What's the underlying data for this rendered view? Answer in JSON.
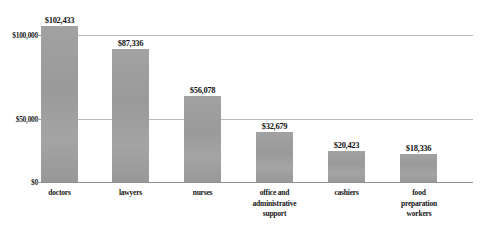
{
  "chart_data": {
    "type": "bar",
    "title": "",
    "subtitle": "",
    "xlabel": "",
    "ylabel": "",
    "categories": [
      "doctors",
      "lawyers",
      "nurses",
      "office and administrative support",
      "cashiers",
      "food preparation workers"
    ],
    "category_lines": [
      [
        "doctors"
      ],
      [
        "lawyers"
      ],
      [
        "nurses"
      ],
      [
        "office and",
        "administrative",
        "support"
      ],
      [
        "cashiers"
      ],
      [
        "food",
        "preparation",
        "workers"
      ]
    ],
    "values": [
      102433,
      87336,
      56078,
      32679,
      20423,
      18336
    ],
    "value_labels": [
      "$102,433",
      "$87,336",
      "$56,078",
      "$32,679",
      "$20,423",
      "$18,336"
    ],
    "ylim": [
      0,
      110000
    ],
    "ytick_values": [
      0,
      50000,
      100000
    ],
    "ytick_labels": [
      "$0",
      "$50,000",
      "$100,000"
    ],
    "grid": true,
    "gridlines_at": [
      50000,
      100000
    ],
    "legend": "none",
    "legend_position": "none",
    "bar_color": "#9d9d9d",
    "gridline_color": "#b9b9bc",
    "axis_color": "#8f8f93",
    "text_color": "#141414",
    "background_color": "#ffffff"
  },
  "artifacts": {
    "top_clipped_text": ""
  }
}
